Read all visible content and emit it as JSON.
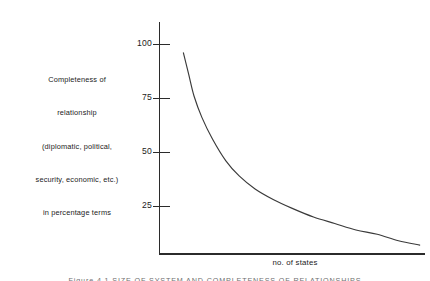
{
  "figure": {
    "background_color": "#ffffff",
    "axis_color": "#2b2b2b",
    "curve_color": "#3a3a3a",
    "text_color": "#1b1b1b",
    "caption_clipped": "Figure 4.1  SIZE OF SYSTEM AND COMPLETENESS OF RELATIONSHIPS"
  },
  "y_axis": {
    "caption_lines": [
      "Completeness of",
      "relationship",
      "(diplomatic, political,",
      "security, economic, etc.)",
      "in percentage terms"
    ],
    "ticks": [
      {
        "label": "100",
        "value": 100
      },
      {
        "label": "75",
        "value": 75
      },
      {
        "label": "50",
        "value": 50
      },
      {
        "label": "25",
        "value": 25
      }
    ]
  },
  "x_axis": {
    "label": "no. of states"
  },
  "chart_data": {
    "type": "line",
    "title": "",
    "subtitle": "",
    "xlabel": "no. of states",
    "ylabel": "Completeness of relationship (diplomatic, political, security, economic, etc.) in percentage terms",
    "xlim": [
      0,
      100
    ],
    "ylim": [
      0,
      107
    ],
    "x_tick_labels": [],
    "y_tick_labels": [
      "25",
      "50",
      "75",
      "100"
    ],
    "grid": false,
    "legend": null,
    "annotations": [],
    "series": [
      {
        "name": "completeness of relationship",
        "x": [
          9,
          11,
          13,
          16,
          20,
          25,
          30,
          36,
          43,
          50,
          58,
          66,
          74,
          82,
          90,
          98
        ],
        "values": [
          96,
          86,
          76,
          66,
          56,
          46,
          39,
          33,
          28,
          24,
          20,
          17,
          14,
          12,
          9,
          7
        ]
      }
    ]
  }
}
